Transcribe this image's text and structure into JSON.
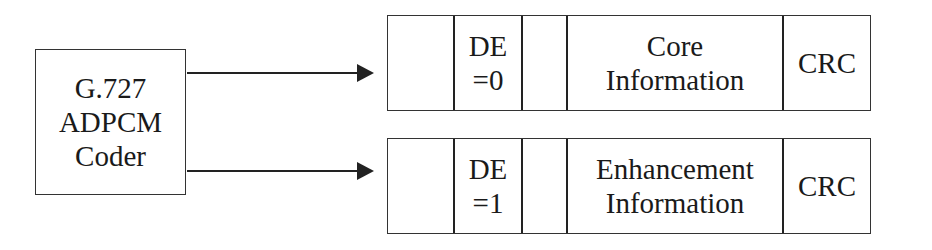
{
  "coder": {
    "lines": [
      "G.727",
      "ADPCM",
      "Coder"
    ]
  },
  "frames": [
    {
      "cells": [
        {
          "lines": []
        },
        {
          "lines": [
            "DE",
            "=0"
          ]
        },
        {
          "lines": []
        },
        {
          "lines": [
            "Core",
            "Information"
          ]
        },
        {
          "lines": [
            "CRC"
          ]
        }
      ]
    },
    {
      "cells": [
        {
          "lines": []
        },
        {
          "lines": [
            "DE",
            "=1"
          ]
        },
        {
          "lines": []
        },
        {
          "lines": [
            "Enhancement",
            "Information"
          ]
        },
        {
          "lines": [
            "CRC"
          ]
        }
      ]
    }
  ]
}
